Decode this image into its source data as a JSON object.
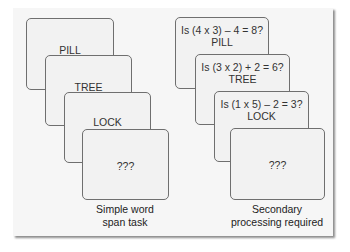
{
  "figure": {
    "left_column": {
      "cards": [
        {
          "lines": [
            "PILL"
          ]
        },
        {
          "lines": [
            "TREE"
          ]
        },
        {
          "lines": [
            "LOCK"
          ]
        },
        {
          "lines": [
            "???"
          ]
        }
      ],
      "caption": [
        "Simple word",
        "span task"
      ]
    },
    "right_column": {
      "cards": [
        {
          "lines": [
            "Is (4 x 3) – 4 = 8?",
            "PILL"
          ]
        },
        {
          "lines": [
            "Is (3 x 2) + 2 = 6?",
            "TREE"
          ]
        },
        {
          "lines": [
            "Is (1 x 5) – 2 = 3?",
            "LOCK"
          ]
        },
        {
          "lines": [
            "???"
          ]
        }
      ],
      "caption": [
        "Secondary",
        "processing required"
      ]
    },
    "colors": {
      "panel_background": "#f6f6f6",
      "card_background": "#f2f2f2",
      "card_border": "#6f6f6f",
      "text": "#333333"
    }
  }
}
